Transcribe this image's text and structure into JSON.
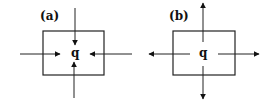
{
  "diagram": {
    "panels": [
      {
        "id": "a",
        "label": "(a)",
        "center_symbol": "q",
        "arrow_direction": "inward",
        "box": {
          "x": 43,
          "y": 31,
          "w": 61,
          "h": 44
        },
        "arrows": [
          {
            "name": "top",
            "x1": 75,
            "y1": 8,
            "x2": 75,
            "y2": 45
          },
          {
            "name": "bottom",
            "x1": 74,
            "y1": 98,
            "x2": 74,
            "y2": 62
          },
          {
            "name": "left",
            "x1": 20,
            "y1": 54,
            "x2": 60,
            "y2": 54
          },
          {
            "name": "right",
            "x1": 132,
            "y1": 54,
            "x2": 90,
            "y2": 54
          }
        ]
      },
      {
        "id": "b",
        "label": "(b)",
        "center_symbol": "q",
        "arrow_direction": "outward",
        "box": {
          "x": 173,
          "y": 31,
          "w": 62,
          "h": 44
        },
        "arrows": [
          {
            "name": "top",
            "x1": 203,
            "y1": 42,
            "x2": 203,
            "y2": 3
          },
          {
            "name": "bottom",
            "x1": 203,
            "y1": 66,
            "x2": 203,
            "y2": 99
          },
          {
            "name": "left",
            "x1": 190,
            "y1": 54,
            "x2": 149,
            "y2": 54
          },
          {
            "name": "right",
            "x1": 218,
            "y1": 54,
            "x2": 259,
            "y2": 54
          }
        ]
      }
    ]
  }
}
